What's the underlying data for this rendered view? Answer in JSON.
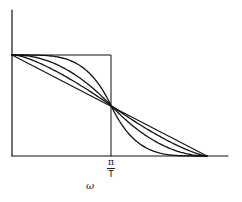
{
  "figure": {
    "type": "diagram",
    "xaxis_label": "ω",
    "tick_label": {
      "numerator": "π",
      "denominator": "T"
    },
    "colors": {
      "line": "#111111",
      "background": "#ffffff"
    }
  },
  "geometry": {
    "origin": [
      12,
      156
    ],
    "yaxis_top": 10,
    "xaxis_right": 228,
    "level_top": 55,
    "cutoff_x": 111,
    "cross_y": 104,
    "rolloff_end_x": 207
  },
  "curves": [
    {
      "name": "ideal-rectangle",
      "rolloff": 0
    },
    {
      "name": "sharp-rolloff",
      "rolloff": 0.25
    },
    {
      "name": "medium-rolloff",
      "rolloff": 0.5
    },
    {
      "name": "wide-rolloff",
      "rolloff": 0.75
    },
    {
      "name": "linear-rolloff",
      "rolloff": 1.0
    }
  ]
}
